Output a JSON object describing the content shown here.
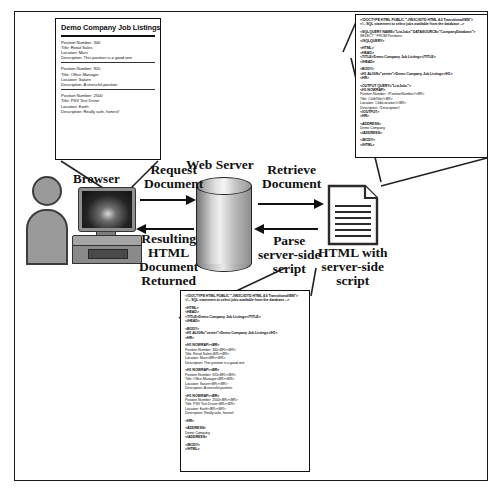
{
  "figure": {
    "frame_color": "#1a1a1a",
    "background": "#ffffff"
  },
  "nodes": {
    "browser_label": "Browser",
    "web_server_label": "Web Server",
    "document_icon_name": "html-document-icon",
    "person_icon_name": "user-person-icon",
    "computer_icon_name": "desktop-computer-icon",
    "server_icon_name": "database-cylinder-icon"
  },
  "arrows": [
    {
      "name": "request-document",
      "direction": "right",
      "label_lines": [
        "Request",
        "Document"
      ]
    },
    {
      "name": "retrieve-document",
      "direction": "right",
      "label_lines": [
        "Retrieve",
        "Document"
      ]
    },
    {
      "name": "resulting-html-document-returned",
      "direction": "left",
      "label_lines": [
        "Resulting",
        "HTML",
        "Document",
        "Returned"
      ]
    },
    {
      "name": "parse-server-side-script",
      "direction": "left",
      "label_lines": [
        "Parse",
        "server-side",
        "script"
      ]
    }
  ],
  "labels": {
    "html_with_server_side_script": [
      "HTML with",
      "server-side",
      "script"
    ]
  },
  "browser_page": {
    "title": "Demo Company Job Listings",
    "jobs": [
      {
        "position_number": "Position Number: 340",
        "title": "Title: Retail Sales",
        "location": "Location: Mars",
        "description": "Description: This position is a good one"
      },
      {
        "position_number": "Position Number: 920",
        "title": "Title: Office Manager",
        "location": "Location: Saturn",
        "description": "Description: A stressful position"
      },
      {
        "position_number": "Position Number: 2500",
        "title": "Title: PSV Test Driver",
        "location": "Location: Earth",
        "description": "Description: Really safe, honest!"
      }
    ]
  },
  "source_code": {
    "name": "html-with-server-side-script",
    "lines": [
      "<!DOCTYPE HTML PUBLIC \"-//W3C//DTD HTML 4.0 Transitional//EN\">",
      "<!-- SQL statement to select jobs available from the database -->",
      "",
      "<SQLQUERY NAME=\"ListJobs\" DATASOURCE=\"CompanyDatabase\">",
      "SELECT * FROM Positions",
      "</SQLQUERY>",
      "",
      "<HTML>",
      "<HEAD>",
      "<TITLE>Demo Company Job Listings</TITLE>",
      "</HEAD>",
      "",
      "<BODY>",
      "<H1 ALIGN=\"center\">Demo Company Job Listings</H1>",
      "<HR>",
      "",
      "<OUTPUT QUERY=\"ListJobs\">",
      "<H1 NOWRAP>",
      "Position Number: #PositionNumber#<BR>",
      "Title: #JobTitle#<BR>",
      "Location: #JobLocation#<BR>",
      "Description: #Description#",
      "</OUTPUT>",
      "<HR>",
      "",
      "<ADDRESS>",
      "Demo Company",
      "</ADDRESS>",
      "",
      "</BODY>",
      "</HTML>"
    ]
  },
  "rendered_code": {
    "name": "resulting-html-document",
    "lines": [
      "<!DOCTYPE HTML PUBLIC \"-//W3C//DTD HTML 4.0 Transitional//EN\">",
      "<!-- SQL statement to select jobs available from the database -->",
      "",
      "<HTML>",
      "<HEAD>",
      "<TITLE>Demo Company Job Listings</TITLE>",
      "</HEAD>",
      "",
      "<BODY>",
      "<H1 ALIGN=\"center\">Demo Company Job Listings</H1>",
      "<HR>",
      "",
      "<H1 NOWRAP><BR>",
      "Position Number: 340<BR><BR>",
      "Title: Retail Sales<BR><BR>",
      "Location: Mars<BR><BR>",
      "Description: This position is a good one",
      "",
      "<H1 NOWRAP><BR>",
      "Position Number: 920<BR><BR>",
      "Title: Office Manager<BR><BR>",
      "Location: Saturn<BR><BR>",
      "Description: A stressful position",
      "",
      "<H1 NOWRAP><BR>",
      "Position Number: 2500<BR><BR>",
      "Title: PSV Test Driver<BR><BR>",
      "Location: Earth<BR><BR>",
      "Description: Really safe, honest!",
      "",
      "<HR>",
      "",
      "<ADDRESS>",
      "Demo Company",
      "</ADDRESS>",
      "",
      "</BODY>",
      "</HTML>"
    ]
  }
}
